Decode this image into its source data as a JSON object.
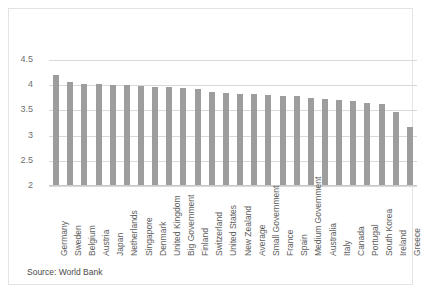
{
  "figure": {
    "source_note": "Source: World Bank",
    "bar_color": "#9d9d9d",
    "grid_color": "#d9d9d9",
    "border_color": "#e3e3e3",
    "text_color": "#5d5d5d"
  },
  "chart_data": {
    "type": "bar",
    "title": "",
    "xlabel": "",
    "ylabel": "",
    "ylim": [
      2,
      4.5
    ],
    "yticks": [
      2,
      2.5,
      3,
      3.5,
      4,
      4.5
    ],
    "ytick_labels": [
      "2",
      "2.5",
      "3",
      "3.5",
      "4",
      "4.5"
    ],
    "grid": true,
    "legend": "none",
    "orientation": "vertical",
    "categories": [
      "Germany",
      "Sweden",
      "Belgium",
      "Austria",
      "Japan",
      "Netherlands",
      "Singapore",
      "Denmark",
      "United Kingdom",
      "Big Government",
      "Finland",
      "Switzerland",
      "United States",
      "New Zealand",
      "Average",
      "Small Government",
      "France",
      "Spain",
      "Medium Government",
      "Australia",
      "Italy",
      "Canada",
      "Portugal",
      "South Korea",
      "Ireland",
      "Greece"
    ],
    "values": [
      4.2,
      4.06,
      4.03,
      4.02,
      4.01,
      4.01,
      3.98,
      3.97,
      3.96,
      3.95,
      3.93,
      3.86,
      3.85,
      3.83,
      3.82,
      3.8,
      3.79,
      3.79,
      3.75,
      3.72,
      3.7,
      3.69,
      3.65,
      3.63,
      3.46,
      3.18
    ],
    "annotations": [
      "Source: World Bank"
    ]
  }
}
